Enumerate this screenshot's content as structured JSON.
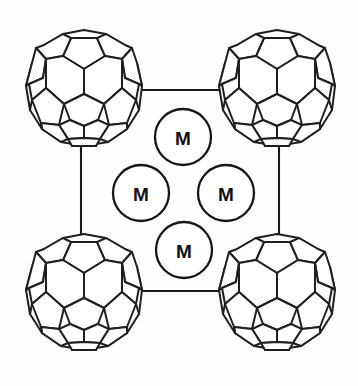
{
  "diagram": {
    "background_color": "#fefefe",
    "line_color": "#1a1a1a",
    "fill_color": "#ffffff",
    "width": 358,
    "height": 386
  },
  "fullerenes": [
    {
      "id": "top-left",
      "label": "",
      "cx": 84,
      "cy": 88,
      "r": 60
    },
    {
      "id": "top-right",
      "label": "",
      "cx": 277,
      "cy": 88,
      "r": 60
    },
    {
      "id": "bottom-left",
      "label": "",
      "cx": 84,
      "cy": 292,
      "r": 60
    },
    {
      "id": "bottom-right",
      "label": "",
      "cx": 277,
      "cy": 292,
      "r": 60
    }
  ],
  "metals": [
    {
      "id": "metal-top",
      "label": "M",
      "cx": 183,
      "cy": 137,
      "r": 28
    },
    {
      "id": "metal-left",
      "label": "M",
      "cx": 141,
      "cy": 193,
      "r": 28
    },
    {
      "id": "metal-right",
      "label": "M",
      "cx": 226,
      "cy": 193,
      "r": 28
    },
    {
      "id": "metal-bottom",
      "label": "M",
      "cx": 184,
      "cy": 250,
      "r": 28
    }
  ],
  "bonds": [
    {
      "id": "bond-top",
      "x1": 123,
      "y1": 90,
      "x2": 238,
      "y2": 90
    },
    {
      "id": "bond-bottom",
      "x1": 123,
      "y1": 291,
      "x2": 238,
      "y2": 291
    },
    {
      "id": "bond-left",
      "x1": 81,
      "y1": 148,
      "x2": 81,
      "y2": 233
    },
    {
      "id": "bond-right",
      "x1": 279,
      "y1": 148,
      "x2": 279,
      "y2": 233
    }
  ]
}
